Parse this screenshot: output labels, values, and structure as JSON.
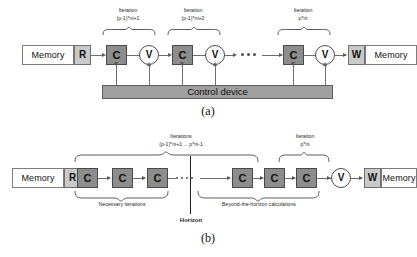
{
  "figure": {
    "panels": [
      {
        "id": "a",
        "caption": "(a)",
        "memory_in": "Memory",
        "read_port": "R",
        "write_port": "W",
        "memory_out": "Memory",
        "control_bar": "Control device",
        "stage_label": "C",
        "verify_label": "V",
        "iteration_labels": [
          {
            "line1": "Iteration",
            "line2": "(p-1)*ni+1"
          },
          {
            "line1": "Iteration",
            "line2": "(p-1)*ni+2"
          },
          {
            "line1": "Iteration",
            "line2": "p*ni"
          }
        ],
        "ellipsis": "•••"
      },
      {
        "id": "b",
        "caption": "(b)",
        "memory_in": "Memory",
        "read_port": "R",
        "write_port": "W",
        "memory_out": "Memory",
        "stage_label": "C",
        "verify_label": "V",
        "iterations_label": {
          "line1": "Iterations",
          "line2": "(p-1)*ni+1 ... p*ni-1"
        },
        "last_iteration_label": {
          "line1": "Iteration",
          "line2": "p*ni"
        },
        "necessary_label": "Necessary iterations",
        "beyond_label": "Beyond-the-horizon calculations",
        "horizon_label": "Horizon",
        "ellipsis": "•••"
      }
    ]
  },
  "colors": {
    "stage_fill": "#8d8d8d",
    "stage_stroke": "#4a4a4a",
    "port_fill": "#c9c9c9",
    "memory_fill": "#ffffff",
    "control_fill": "#a0a0a0",
    "wire": "#6d6d6d",
    "horizon_line": "#1d1d1d"
  }
}
